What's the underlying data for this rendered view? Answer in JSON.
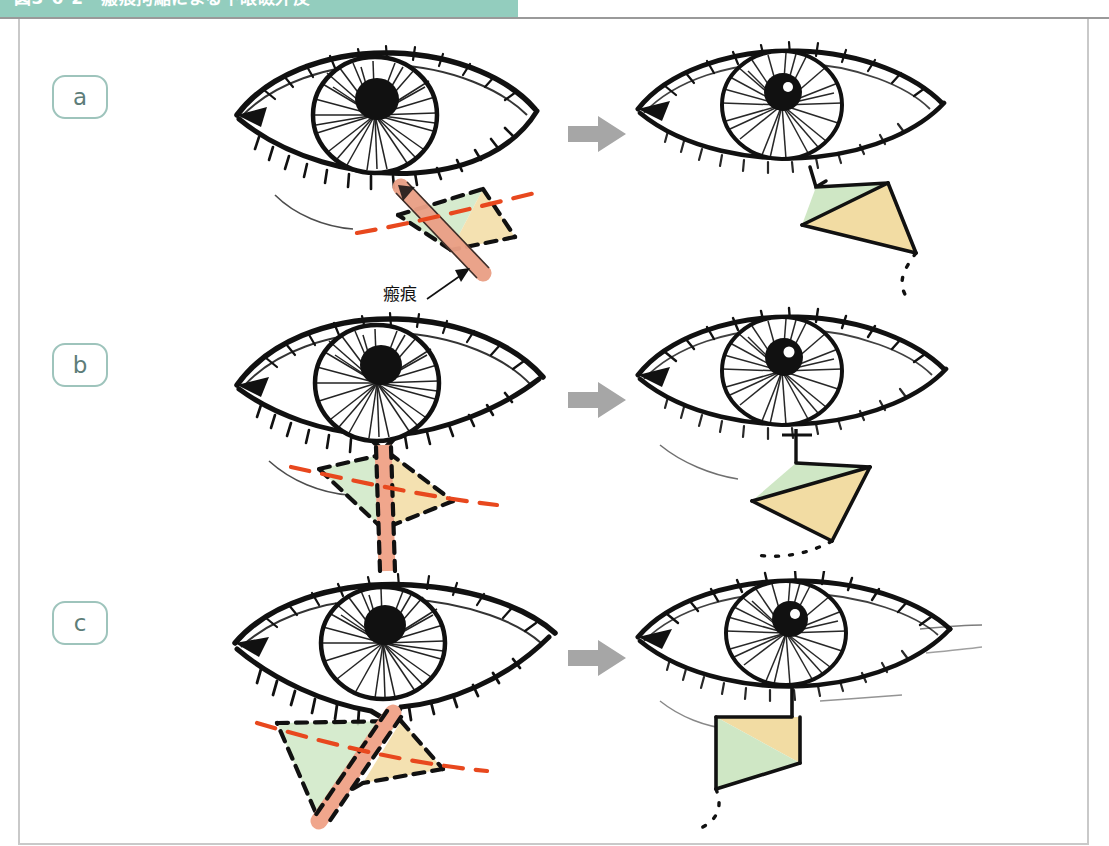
{
  "header": {
    "title": "図3-6-2　瘢痕拘縮による下眼瞼外反",
    "band_color": "#93cdbe",
    "text_color": "#ffffff"
  },
  "figure": {
    "caption_label": "瘢痕",
    "transform_arrow": "arrow-right-icon",
    "panels": [
      {
        "id": "a",
        "tag": "a",
        "before": {
          "name": "oblique-scar-eye",
          "annotation": "瘢痕",
          "has_scar_band": true,
          "scar_orientation": "oblique",
          "flaps": [
            "green",
            "yellow"
          ],
          "rstl_line": true
        },
        "after": {
          "name": "transposed-flaps-eye",
          "flaps": [
            "green",
            "yellow"
          ],
          "dotted_tail": true
        }
      },
      {
        "id": "b",
        "tag": "b",
        "before": {
          "name": "vertical-scar-eye",
          "has_scar_band": true,
          "scar_orientation": "vertical",
          "flaps": [
            "green",
            "yellow"
          ],
          "rstl_line": true
        },
        "after": {
          "name": "transposed-flaps-eye",
          "flaps": [
            "green",
            "yellow"
          ],
          "dotted_tail": true
        }
      },
      {
        "id": "c",
        "tag": "c",
        "before": {
          "name": "severe-oblique-scar-eye",
          "has_scar_band": true,
          "scar_orientation": "oblique-steep",
          "flaps": [
            "green",
            "yellow"
          ],
          "rstl_line": true
        },
        "after": {
          "name": "transposed-flaps-eye",
          "flaps": [
            "yellow",
            "green"
          ],
          "dotted_tail": true
        }
      }
    ]
  },
  "colors": {
    "flap_green": "#cfe7c5",
    "flap_yellow": "#f2dca3",
    "scar_pink": "#f0a68c",
    "rstl_orange": "#e8481e",
    "ink_black": "#111111",
    "arrow_gray": "#a6a6a6",
    "tag_border": "#9ec4bc",
    "tag_text": "#5d7d79",
    "frame_gray": "#c9c9c9"
  }
}
